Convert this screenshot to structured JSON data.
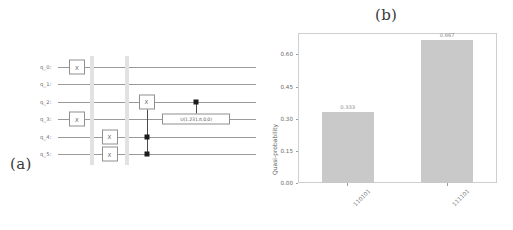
{
  "figure": {
    "panel_a_label": "(a)",
    "panel_b_label": "(b)"
  },
  "circuit": {
    "qubits": [
      {
        "label": "q_0:"
      },
      {
        "label": "q_1:"
      },
      {
        "label": "q_2:"
      },
      {
        "label": "q_3:"
      },
      {
        "label": "q_4:"
      },
      {
        "label": "q_5:"
      }
    ],
    "gates": [
      {
        "name": "x-gate-q0",
        "text": "X",
        "wire": 0,
        "col": 0
      },
      {
        "name": "x-gate-q3",
        "text": "X",
        "wire": 3,
        "col": 0
      },
      {
        "name": "x-gate-q4",
        "text": "X",
        "wire": 4,
        "col": 1
      },
      {
        "name": "x-gate-q5",
        "text": "X",
        "wire": 5,
        "col": 1
      },
      {
        "name": "x-gate-q2-controlled",
        "text": "X",
        "wire": 2,
        "col": 2
      },
      {
        "name": "u-gate-q3",
        "text": "U(1.231,π,0,0)",
        "wire": 3,
        "col": 3
      }
    ],
    "controls": [
      {
        "name": "control-dot-q4",
        "wire": 4
      },
      {
        "name": "control-dot-q5",
        "wire": 5
      },
      {
        "name": "control-dot-q2",
        "wire": 2
      }
    ],
    "barriers": 2
  },
  "chart_data": {
    "type": "bar",
    "title": "(b)",
    "xlabel": "",
    "ylabel": "Quasi-probability",
    "categories": [
      "110101",
      "111101"
    ],
    "values": [
      0.333,
      0.667
    ],
    "value_labels": [
      "0.333",
      "0.667"
    ],
    "yticks": [
      "0.00",
      "0.15",
      "0.30",
      "0.45",
      "0.60"
    ],
    "ytick_values": [
      0.0,
      0.15,
      0.3,
      0.45,
      0.6
    ],
    "ylim": [
      0.0,
      0.7
    ],
    "grid": false,
    "legend": null,
    "bar_color": "#c9c9c9"
  }
}
